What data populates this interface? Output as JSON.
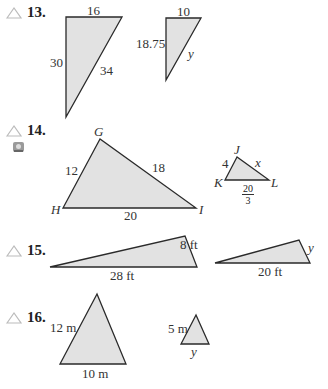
{
  "problems": [
    {
      "number": "13.",
      "big": {
        "top": "16",
        "left": "30",
        "hyp": "34"
      },
      "small": {
        "top": "10",
        "left": "18.75",
        "hyp": "y"
      }
    },
    {
      "number": "14.",
      "big": {
        "vertices": [
          "G",
          "H",
          "I"
        ],
        "GH": "12",
        "GI": "18",
        "HI": "20"
      },
      "small": {
        "vertices": [
          "J",
          "K",
          "L"
        ],
        "JK": "4",
        "JL": "x",
        "KL_num": "20",
        "KL_den": "3"
      }
    },
    {
      "number": "15.",
      "big": {
        "side": "8 ft",
        "base": "28 ft"
      },
      "small": {
        "side": "y",
        "base": "20 ft"
      }
    },
    {
      "number": "16.",
      "big": {
        "side": "12 m",
        "base": "10 m"
      },
      "small": {
        "side": "5 m",
        "base": "y"
      }
    }
  ],
  "colors": {
    "fill": "#e2e2e2",
    "stroke": "#2a2a2a",
    "icon": "#b8b8b8"
  }
}
